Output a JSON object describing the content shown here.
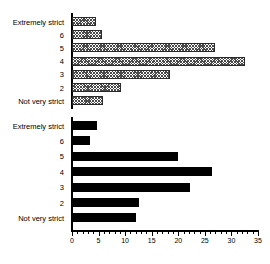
{
  "chart_data": {
    "type": "bar",
    "orientation": "horizontal",
    "title": "",
    "xlabel": "",
    "ylabel": "",
    "xlim": [
      0,
      35
    ],
    "xticks": [
      0,
      5,
      10,
      15,
      20,
      25,
      30,
      35
    ],
    "xtick_labels": [
      "0",
      "5",
      "10",
      "15",
      "20",
      "25",
      "30",
      "35"
    ],
    "minor_tick_step": 1,
    "grid": false,
    "legend": "none",
    "categories": [
      "Extremely strict",
      "6",
      "5",
      "4",
      "3",
      "2",
      "Not very strict"
    ],
    "series": [
      {
        "name": "series-hatched",
        "style": "hatched",
        "color": "#4a4a4a",
        "values": [
          4.5,
          5.6,
          26.9,
          32.5,
          18.5,
          9.3,
          5.8
        ]
      },
      {
        "name": "series-solid",
        "style": "solid",
        "color": "#000000",
        "values": [
          4.7,
          3.4,
          20.0,
          26.3,
          22.2,
          12.7,
          12.0
        ]
      }
    ]
  }
}
